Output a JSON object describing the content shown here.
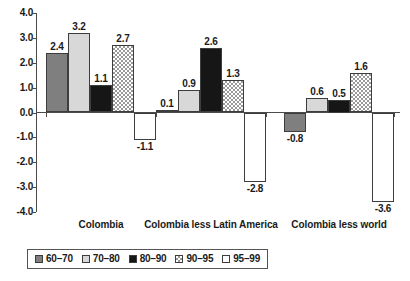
{
  "chart_data": {
    "type": "bar",
    "title": "",
    "subtitle": "",
    "xlabel": "",
    "ylabel": "",
    "ylim": [
      -4.0,
      4.0
    ],
    "grid": false,
    "legend_position": "bottom",
    "y_ticks": [
      "4.0",
      "3.0",
      "2.0",
      "1.0",
      "0.0",
      "-1.0",
      "-2.0",
      "-3.0",
      "-4.0"
    ],
    "y_tick_values": [
      4.0,
      3.0,
      2.0,
      1.0,
      0.0,
      -1.0,
      -2.0,
      -3.0,
      -4.0
    ],
    "categories": [
      "Colombia",
      "Colombia less Latin America",
      "Colombia less world"
    ],
    "series": [
      {
        "name": "60–70",
        "fill": "fill-dark",
        "values": [
          2.4,
          0.1,
          -0.8
        ],
        "labels": [
          "2.4",
          "0.1",
          "-0.8"
        ]
      },
      {
        "name": "70–80",
        "fill": "fill-light",
        "values": [
          3.2,
          0.9,
          0.6
        ],
        "labels": [
          "3.2",
          "0.9",
          "0.6"
        ]
      },
      {
        "name": "80–90",
        "fill": "fill-black",
        "values": [
          1.1,
          2.6,
          0.5
        ],
        "labels": [
          "1.1",
          "2.6",
          "0.5"
        ]
      },
      {
        "name": "90–95",
        "fill": "fill-hatch",
        "values": [
          2.7,
          1.3,
          1.6
        ],
        "labels": [
          "2.7",
          "1.3",
          "1.6"
        ]
      },
      {
        "name": "95–99",
        "fill": "fill-white",
        "values": [
          -1.1,
          -2.8,
          -3.6
        ],
        "labels": [
          "-1.1",
          "-2.8",
          "-3.6"
        ]
      }
    ]
  },
  "legend": {
    "items": [
      {
        "label": "60–70",
        "fill": "fill-dark"
      },
      {
        "label": "70–80",
        "fill": "fill-light"
      },
      {
        "label": "80–90",
        "fill": "fill-black"
      },
      {
        "label": "90–95",
        "fill": "fill-hatch"
      },
      {
        "label": "95–99",
        "fill": "fill-white"
      }
    ]
  },
  "colors": {
    "axis": "#4a4a4a",
    "text": "#1a1a1a",
    "series_60_70": "#7f7f7f",
    "series_70_80": "#d8d8d8",
    "series_80_90": "#161616",
    "series_90_95": "#9a9a9a",
    "series_95_99": "#ffffff"
  }
}
